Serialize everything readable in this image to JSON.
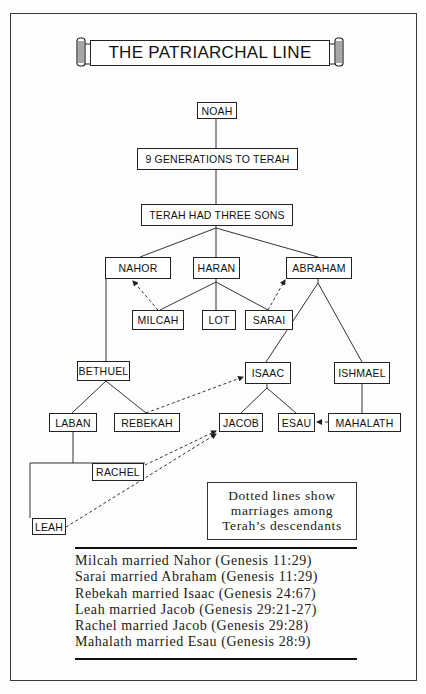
{
  "title": "THE PATRIARCHAL LINE",
  "tree": {
    "noah": "NOAH",
    "generations": "9 GENERATIONS TO TERAH",
    "terah": "TERAH HAD THREE SONS",
    "sons": [
      "NAHOR",
      "HARAN",
      "ABRAHAM"
    ],
    "haran_children": [
      "MILCAH",
      "LOT",
      "SARAI"
    ],
    "bethuel": "BETHUEL",
    "bethuel_children": [
      "LABAN",
      "REBEKAH"
    ],
    "abraham_children": [
      "ISAAC",
      "ISHMAEL"
    ],
    "isaac_children": [
      "JACOB",
      "ESAU"
    ],
    "ishmael_child": "MAHALATH",
    "laban_children": [
      "RACHEL",
      "LEAH"
    ]
  },
  "edges": {
    "solid": [
      [
        "NOAH",
        "9 GENERATIONS TO TERAH"
      ],
      [
        "9 GENERATIONS TO TERAH",
        "TERAH HAD THREE SONS"
      ],
      [
        "TERAH HAD THREE SONS",
        "NAHOR"
      ],
      [
        "TERAH HAD THREE SONS",
        "HARAN"
      ],
      [
        "TERAH HAD THREE SONS",
        "ABRAHAM"
      ],
      [
        "HARAN",
        "MILCAH"
      ],
      [
        "HARAN",
        "LOT"
      ],
      [
        "HARAN",
        "SARAI"
      ],
      [
        "NAHOR",
        "BETHUEL"
      ],
      [
        "ABRAHAM",
        "ISAAC"
      ],
      [
        "ABRAHAM",
        "ISHMAEL"
      ],
      [
        "BETHUEL",
        "LABAN"
      ],
      [
        "BETHUEL",
        "REBEKAH"
      ],
      [
        "ISAAC",
        "JACOB"
      ],
      [
        "ISAAC",
        "ESAU"
      ],
      [
        "ISHMAEL",
        "MAHALATH"
      ],
      [
        "LABAN",
        "RACHEL"
      ],
      [
        "LABAN",
        "LEAH"
      ]
    ],
    "dotted_marriages": [
      [
        "MILCAH",
        "NAHOR"
      ],
      [
        "SARAI",
        "ABRAHAM"
      ],
      [
        "REBEKAH",
        "ISAAC"
      ],
      [
        "RACHEL",
        "JACOB"
      ],
      [
        "LEAH",
        "JACOB"
      ],
      [
        "MAHALATH",
        "ESAU"
      ]
    ]
  },
  "legend": {
    "lines": [
      "Dotted lines show",
      "marriages among",
      "Terah’s descendants"
    ]
  },
  "marriages": [
    "Milcah married Nahor (Genesis 11:29)",
    "Sarai married Abraham (Genesis 11:29)",
    "Rebekah married Isaac (Genesis 24:67)",
    "Leah married Jacob (Genesis 29:21-27)",
    "Rachel married Jacob (Genesis 29:28)",
    "Mahalath married Esau (Genesis 28:9)"
  ]
}
